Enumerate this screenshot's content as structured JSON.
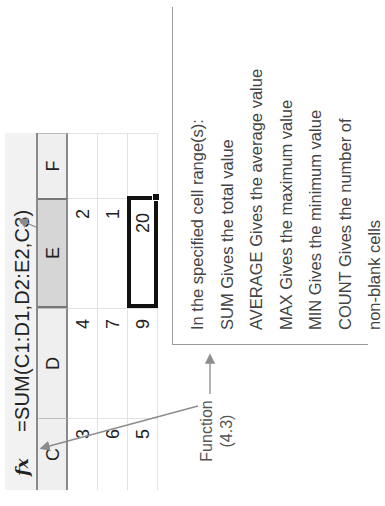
{
  "orientation": "rotated -90deg (content reads bottom-to-top)",
  "formula_bar": {
    "icon": "fx-icon",
    "icon_label": "fx",
    "formula": "=SUM(C1:D1,D2:E2,C3)"
  },
  "columns": [
    {
      "label": "C",
      "selected": false
    },
    {
      "label": "D",
      "selected": false
    },
    {
      "label": "E",
      "selected": true
    },
    {
      "label": "F",
      "selected": false
    }
  ],
  "rows": [
    {
      "C": "3",
      "D": "4",
      "E": "2",
      "F": ""
    },
    {
      "C": "6",
      "D": "7",
      "E": "1",
      "F": ""
    },
    {
      "C": "5",
      "D": "9",
      "E": "20",
      "F": ""
    }
  ],
  "selected_cell": {
    "ref": "E3",
    "value": "20"
  },
  "callout": {
    "lines": [
      "In the specified cell range(s):",
      "SUM Gives the total value",
      "AVERAGE Gives the average value",
      "MAX Gives the maximum value",
      "MIN Gives the minimum value",
      "COUNT Gives the number of",
      "non-blank cells"
    ]
  },
  "function_label": {
    "line1": "Function",
    "line2": "(4.3)"
  },
  "colors": {
    "header_bg": "#efefef",
    "selected_header_bg": "#d6d6d6",
    "arrow": "#8c8c8c",
    "selection_border": "#111111"
  }
}
